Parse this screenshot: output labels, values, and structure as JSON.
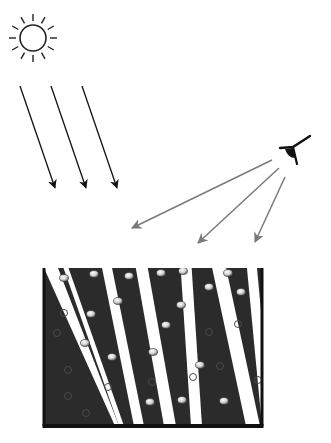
{
  "diagram": {
    "colors": {
      "background": "#ffffff",
      "sun_stroke": "#222222",
      "sun_rays": "#111111",
      "view_rays": "#7a7a7a",
      "container_fill": "#2b2b2b",
      "rod_cap": "#dcdcdc"
    },
    "sun": {
      "icon": "sun-icon",
      "cx": 33,
      "cy": 38,
      "r": 13
    },
    "incident_rays": [
      {
        "x1": 20,
        "y1": 86,
        "x2": 55,
        "y2": 188
      },
      {
        "x1": 51,
        "y1": 86,
        "x2": 86,
        "y2": 188
      },
      {
        "x1": 82,
        "y1": 86,
        "x2": 117,
        "y2": 188
      }
    ],
    "observer": {
      "icon": "eye-icon",
      "x": 296,
      "y": 150
    },
    "view_rays": [
      {
        "x1": 272,
        "y1": 160,
        "x2": 132,
        "y2": 228
      },
      {
        "x1": 279,
        "y1": 168,
        "x2": 198,
        "y2": 243
      },
      {
        "x1": 285,
        "y1": 177,
        "x2": 255,
        "y2": 242
      }
    ],
    "container": {
      "x": 44,
      "y": 268,
      "width": 218,
      "height": 158
    },
    "stripes": [
      {
        "top_x": 60,
        "bottom_x": 119,
        "width": 5
      },
      {
        "top_x": 100,
        "bottom_x": 134,
        "width": 10
      },
      {
        "top_x": 134,
        "bottom_x": 164,
        "width": 12
      },
      {
        "top_x": 180,
        "bottom_x": 191,
        "width": 11
      },
      {
        "top_x": 210,
        "bottom_x": 246,
        "width": 14
      },
      {
        "top_x": 246,
        "bottom_x": 262,
        "width": 10
      }
    ],
    "rod_caps": [
      [
        64,
        278
      ],
      [
        94,
        274
      ],
      [
        129,
        276
      ],
      [
        161,
        273
      ],
      [
        183,
        271
      ],
      [
        228,
        273
      ],
      [
        209,
        287
      ],
      [
        241,
        292
      ],
      [
        118,
        301
      ],
      [
        91,
        314
      ],
      [
        181,
        305
      ],
      [
        166,
        325
      ],
      [
        85,
        343
      ],
      [
        112,
        357
      ],
      [
        153,
        352
      ],
      [
        200,
        365
      ],
      [
        150,
        402
      ],
      [
        182,
        400
      ],
      [
        224,
        401
      ]
    ],
    "bubbles": [
      [
        64,
        313
      ],
      [
        57,
        333
      ],
      [
        68,
        370
      ],
      [
        68,
        396
      ],
      [
        86,
        413
      ],
      [
        108,
        387
      ],
      [
        152,
        382
      ],
      [
        193,
        377
      ],
      [
        209,
        332
      ],
      [
        220,
        366
      ],
      [
        258,
        380
      ],
      [
        238,
        324
      ]
    ]
  }
}
